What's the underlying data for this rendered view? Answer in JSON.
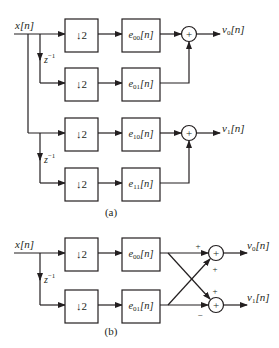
{
  "figure": {
    "part_a": {
      "caption": "(a)",
      "input_label": "x[n]",
      "delay_label_1": "z",
      "delay_label_2": "z",
      "delay_exp": "−1",
      "rows": [
        {
          "downsample": "↓2",
          "filter": "e",
          "filter_sub": "00",
          "filter_arg": "[n]"
        },
        {
          "downsample": "↓2",
          "filter": "e",
          "filter_sub": "01",
          "filter_arg": "[n]"
        },
        {
          "downsample": "↓2",
          "filter": "e",
          "filter_sub": "10",
          "filter_arg": "[n]"
        },
        {
          "downsample": "↓2",
          "filter": "e",
          "filter_sub": "11",
          "filter_arg": "[n]"
        }
      ],
      "adders": [
        {
          "symbol": "+"
        },
        {
          "symbol": "+"
        }
      ],
      "outputs": [
        {
          "name": "v",
          "sub": "0",
          "arg": "[n]"
        },
        {
          "name": "v",
          "sub": "1",
          "arg": "[n]"
        }
      ]
    },
    "part_b": {
      "caption": "(b)",
      "input_label": "x[n]",
      "delay_label": "z",
      "delay_exp": "−1",
      "rows": [
        {
          "downsample": "↓2",
          "filter": "e",
          "filter_sub": "00",
          "filter_arg": "[n]"
        },
        {
          "downsample": "↓2",
          "filter": "e",
          "filter_sub": "01",
          "filter_arg": "[n]"
        }
      ],
      "adders": [
        {
          "symbol": "+"
        },
        {
          "symbol": "+"
        }
      ],
      "signs": {
        "top_adder_upper": "+",
        "top_adder_lower": "+",
        "bottom_adder_upper": "+",
        "bottom_adder_lower": "−"
      },
      "outputs": [
        {
          "name": "v",
          "sub": "0",
          "arg": "[n]"
        },
        {
          "name": "v",
          "sub": "1",
          "arg": "[n]"
        }
      ]
    }
  }
}
